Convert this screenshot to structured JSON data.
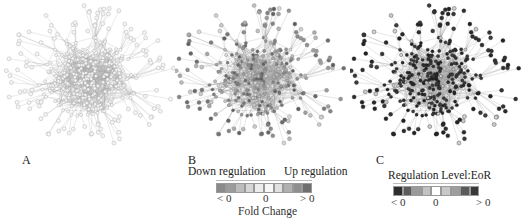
{
  "figure": {
    "panels": [
      {
        "id": "A",
        "label": "A",
        "description": "Protein interaction network, uncolored nodes",
        "node_style": "hollow-light",
        "node_color": "#d8d8d8",
        "edge_color": "#b8b8b8"
      },
      {
        "id": "B",
        "label": "B",
        "description": "Network colored by fold change",
        "node_style": "filled-gradient",
        "legend": {
          "left_title": "Down regulation",
          "right_title": "Up regulation",
          "ticks": [
            "< 0",
            "0",
            "> 0"
          ],
          "axis_title": "Fold Change",
          "colors": [
            "#8a8a8a",
            "#9c9c9c",
            "#bcbcbc",
            "#d6d6d6",
            "#ececec",
            "#f6f6f6",
            "#e0e0e0",
            "#b0b0b0",
            "#8e8e8e",
            "#6e6e6e"
          ]
        }
      },
      {
        "id": "C",
        "label": "C",
        "description": "Network colored by regulation level (EoR)",
        "node_style": "filled-dark",
        "legend": {
          "title": "Regulation Level:EoR",
          "ticks": [
            "< 0",
            "0",
            "> 0"
          ],
          "colors": [
            "#2e2e2e",
            "#5c5c5c",
            "#9a9a9a",
            "#c2c2c2",
            "#ffffff",
            "#c8c8c8",
            "#9e9e9e",
            "#5a5a5a",
            "#383838"
          ]
        }
      }
    ]
  }
}
